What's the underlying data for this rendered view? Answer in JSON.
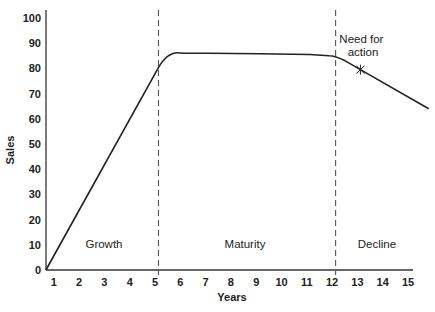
{
  "chart_data": {
    "type": "line",
    "title": "",
    "xlabel": "Years",
    "ylabel": "Sales",
    "xlim": [
      0.57,
      15.1
    ],
    "ylim": [
      0,
      100
    ],
    "grid": false,
    "legend": null,
    "x_ticks": [
      1,
      2,
      3,
      4,
      5,
      6,
      7,
      8,
      9,
      10,
      11,
      12,
      13,
      14,
      15
    ],
    "y_ticks": [
      0,
      10,
      20,
      30,
      40,
      50,
      60,
      70,
      80,
      90,
      100
    ],
    "series": [
      {
        "name": "Sales",
        "x": [
          0.57,
          5.0,
          5.4,
          5.8,
          7.0,
          9.0,
          11.0,
          12.0,
          12.4,
          13.0,
          15.7
        ],
        "y": [
          0,
          80,
          85,
          86,
          86,
          85.8,
          85.5,
          85,
          83,
          79.5,
          64
        ]
      }
    ],
    "phase_dividers": [
      {
        "x": 5,
        "style": "dashed"
      },
      {
        "x": 12,
        "style": "dashed"
      }
    ],
    "phases": [
      {
        "label": "Growth",
        "x_center": 2.9
      },
      {
        "label": "Maturity",
        "x_center": 8.5
      },
      {
        "label": "Decline",
        "x_center": 13.7
      }
    ],
    "annotations": [
      {
        "text": "Need for action",
        "lines": [
          "Need for",
          "action"
        ],
        "marker": "asterisk",
        "x": 13,
        "y": 79.5
      }
    ]
  },
  "labels": {
    "xlabel": "Years",
    "ylabel": "Sales",
    "phase_growth": "Growth",
    "phase_maturity": "Maturity",
    "phase_decline": "Decline",
    "annot_line1": "Need for",
    "annot_line2": "action",
    "y_ticks": [
      "0",
      "10",
      "20",
      "30",
      "40",
      "50",
      "60",
      "70",
      "80",
      "90",
      "100"
    ],
    "x_ticks": [
      "1",
      "2",
      "3",
      "4",
      "5",
      "6",
      "7",
      "8",
      "9",
      "10",
      "11",
      "12",
      "13",
      "14",
      "15"
    ]
  },
  "colors": {
    "line": "#222222",
    "axis": "#333333",
    "divider": "#555555"
  }
}
